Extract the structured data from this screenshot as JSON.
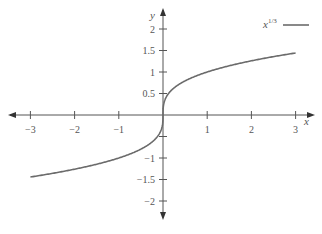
{
  "chart_data": {
    "type": "line",
    "title": "",
    "xlabel": "x",
    "ylabel": "y",
    "xlim": [
      -3.3,
      3.3
    ],
    "ylim": [
      -2.3,
      2.3
    ],
    "grid": false,
    "legend_position": "top-right",
    "x_ticks": [
      -3,
      -2,
      -1,
      1,
      2,
      3
    ],
    "x_tick_labels": [
      "−3",
      "−2",
      "−1",
      "1",
      "2",
      "3"
    ],
    "y_ticks": [
      -2,
      -1.5,
      -1,
      -0.5,
      0.5,
      1,
      1.5,
      2
    ],
    "y_tick_labels": [
      "−2",
      "−1.5",
      "−1",
      "",
      "0.5",
      "1",
      "1.5",
      "2"
    ],
    "series": [
      {
        "name": "x^{1/3}",
        "function": "cube root",
        "color": "#6b6b6b",
        "x": [
          -3,
          -2.5,
          -2,
          -1.5,
          -1,
          -0.5,
          -0.25,
          -0.1,
          -0.02,
          0,
          0.02,
          0.1,
          0.25,
          0.5,
          1,
          1.5,
          2,
          2.5,
          3
        ],
        "values": [
          -1.442,
          -1.357,
          -1.26,
          -1.145,
          -1.0,
          -0.794,
          -0.63,
          -0.464,
          -0.271,
          0,
          0.271,
          0.464,
          0.63,
          0.794,
          1.0,
          1.145,
          1.26,
          1.357,
          1.442
        ]
      }
    ]
  },
  "legend": {
    "label_base": "x",
    "label_exp": "1/3"
  },
  "axes": {
    "x_label": "x",
    "y_label": "y",
    "color": "#555555"
  }
}
